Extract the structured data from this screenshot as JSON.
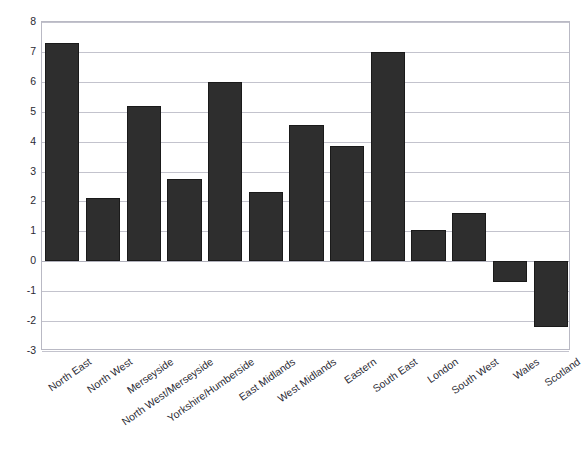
{
  "title": "",
  "chart_data": {
    "type": "bar",
    "title": "",
    "subtitle": "",
    "xlabel": "",
    "ylabel": "",
    "ylim": [
      -3,
      8
    ],
    "ytick_step": 1,
    "yticks": [
      "8",
      "7",
      "6",
      "5",
      "4",
      "3",
      "2",
      "1",
      "0",
      "-1",
      "-2",
      "-3"
    ],
    "grid": true,
    "legend": false,
    "legend_position": "none",
    "bar_color": "#2e2e2e",
    "categories": [
      "North East",
      "North West",
      "Merseyside",
      "North West/Merseyside",
      "Yorkshire/Humberside",
      "East Midlands",
      "West Midlands",
      "Eastern",
      "South East",
      "London",
      "South West",
      "Wales",
      "Scotland"
    ],
    "values": [
      7.3,
      2.1,
      5.2,
      2.75,
      6.0,
      2.3,
      4.55,
      3.85,
      7.0,
      1.05,
      1.6,
      -0.7,
      -2.2
    ]
  },
  "colors": {
    "bar": "#2e2e2e",
    "bar_edge": "#1a1a1a",
    "grid": "#c3c3cd",
    "frame": "#b9b9c4",
    "text": "#2a2a33",
    "background": "#ffffff"
  }
}
